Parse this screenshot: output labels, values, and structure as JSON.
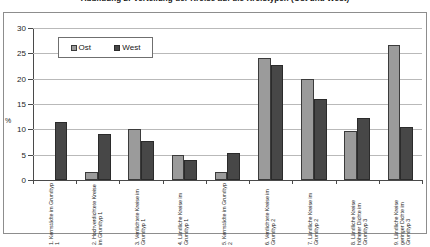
{
  "chart": {
    "title": "Abbildung 2: Verteilung der Kreise auf die Kreistypen (Ost und West)",
    "y_unit_label": "%"
  },
  "legend": {
    "position": "top-left-inside",
    "entries": [
      {
        "label": "Ost",
        "color": "#9b9b9b"
      },
      {
        "label": "West",
        "color": "#474747"
      }
    ]
  },
  "chart_data": {
    "type": "bar",
    "title": "Abbildung 2: Verteilung der Kreise auf die Kreistypen (Ost und West)",
    "xlabel": "",
    "ylabel": "%",
    "ylim": [
      0,
      30
    ],
    "yticks": [
      0,
      5,
      10,
      15,
      20,
      25,
      30
    ],
    "grid": true,
    "legend_position": "upper left",
    "categories": [
      "1. Kernstädte im Grundtyp 1",
      "2. Hochverdichtete Kreise im Grundtyp 1",
      "3. Verdichtete Kreise im Grundtyp 1",
      "4. Ländliche Kreise im Grundtyp 1",
      "5. Kernstädte im Grundtyp 2",
      "6. Verdichtete Kreise im Grundtyp 2",
      "7. Ländliche Kreise im Grundtyp 2",
      "8. Ländliche Kreise höherer Dichte im Grundtyp 3",
      "9. Ländliche Kreise geringer Dichte im Grundtyp 3"
    ],
    "series": [
      {
        "name": "Ost",
        "color": "#9b9b9b",
        "values": [
          0,
          1.6,
          10.0,
          5.0,
          1.5,
          24.0,
          20.0,
          9.7,
          26.7
        ]
      },
      {
        "name": "West",
        "color": "#474747",
        "values": [
          11.5,
          9.0,
          7.7,
          4.0,
          5.3,
          22.7,
          16.0,
          12.2,
          10.5
        ]
      }
    ]
  }
}
